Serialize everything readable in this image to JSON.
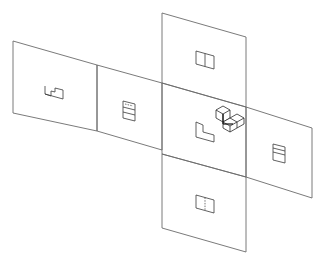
{
  "diagram": {
    "type": "unfolded-projection-box",
    "colors": {
      "background": "#ffffff",
      "plane_edge": "#6b6b6b",
      "view_line": "#3a3a3a"
    },
    "planes": [
      {
        "id": "left-far",
        "label": "Rear view plane",
        "view": "rear"
      },
      {
        "id": "left-near",
        "label": "Left side view plane",
        "view": "left-side"
      },
      {
        "id": "top",
        "label": "Top view plane",
        "view": "top"
      },
      {
        "id": "center",
        "label": "Front view plane",
        "view": "front"
      },
      {
        "id": "right",
        "label": "Right side view plane",
        "view": "right-side"
      },
      {
        "id": "bottom",
        "label": "Bottom view plane",
        "view": "bottom"
      }
    ],
    "object": {
      "label": "Isometric L-shaped block"
    }
  }
}
